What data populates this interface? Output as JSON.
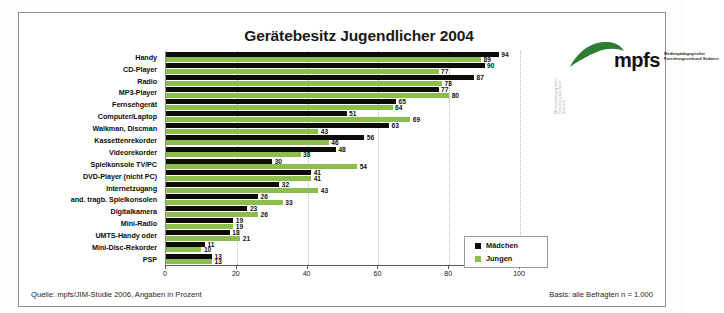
{
  "chart_data": {
    "type": "bar",
    "orientation": "horizontal",
    "title": "Gerätebesitz Jugendlicher 2004",
    "xlabel": "",
    "ylabel": "",
    "xlim": [
      0,
      100
    ],
    "xticks": [
      0,
      20,
      40,
      60,
      80,
      100
    ],
    "grid": "vertical-dotted",
    "legend_position": "inside-right",
    "categories": [
      "Handy",
      "CD-Player",
      "Radio",
      "MP3-Player",
      "Fernsehgerät",
      "Computer/Laptop",
      "Walkman, Discman",
      "Kassettenrekorder",
      "Videorekorder",
      "Spielkonsole TV/PC",
      "DVD-Player (nicht PC)",
      "Internetzugang",
      "and. tragb. Spielkonsolen",
      "Digitalkamera",
      "Mini-Radio",
      "UMTS-Handy oder",
      "Mini-Disc-Rekorder",
      "PSP"
    ],
    "series": [
      {
        "name": "Mädchen",
        "color": "#0b0b07",
        "values": [
          94,
          90,
          87,
          77,
          65,
          51,
          63,
          56,
          48,
          30,
          41,
          32,
          26,
          23,
          19,
          18,
          11,
          13
        ]
      },
      {
        "name": "Jungen",
        "color": "#8cbe4e",
        "values": [
          89,
          77,
          78,
          80,
          64,
          69,
          43,
          46,
          38,
          54,
          41,
          43,
          33,
          26,
          19,
          21,
          10,
          13
        ]
      }
    ]
  },
  "legend": {
    "items": [
      {
        "label": "Mädchen",
        "color": "#0b0b07"
      },
      {
        "label": "Jungen",
        "color": "#8cbe4e"
      }
    ]
  },
  "logo": {
    "wordmark": "mpfs",
    "subtitle": "Medienpädagogischer Forschungsverbund Südwest",
    "sidetext": "Medienpädagogischer Forschungsverbund Südwest"
  },
  "footer": {
    "source": "Quelle: mpfs/JIM-Studie 2006, Angaben in Prozent",
    "basis": "Basis: alle Befragten n = 1.000"
  }
}
